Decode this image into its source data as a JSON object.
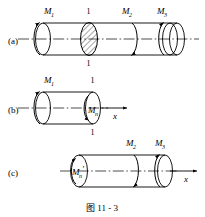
{
  "figure": {
    "caption": "图 11 - 3",
    "caption_number": "11 - 3",
    "caption_prefix": "图",
    "axis_label": "x",
    "section_marker": "1",
    "line_color": "#000000",
    "background_color": "#ffffff",
    "hatch_color": "#000000"
  },
  "panels": [
    {
      "id": "(a)",
      "name": "full-shaft",
      "torques": [
        {
          "base": "M",
          "sub": "1",
          "position": "left-end"
        },
        {
          "base": "M",
          "sub": "2",
          "position": "middle-right"
        },
        {
          "base": "M",
          "sub": "3",
          "position": "right-end"
        }
      ],
      "section_labels": [
        {
          "text": "1",
          "position": "top"
        },
        {
          "text": "1",
          "position": "bottom"
        }
      ],
      "has_hatched_section": true,
      "has_axis_arrow": false
    },
    {
      "id": "(b)",
      "name": "left-free-body",
      "torques": [
        {
          "base": "M",
          "sub": "1",
          "position": "left-end"
        },
        {
          "base": "M",
          "sub": "n",
          "position": "cut-face"
        }
      ],
      "section_labels": [
        {
          "text": "1",
          "position": "top"
        },
        {
          "text": "1",
          "position": "bottom"
        }
      ],
      "has_hatched_section": false,
      "has_axis_arrow": true,
      "axis_label": "x"
    },
    {
      "id": "(c)",
      "name": "right-free-body",
      "torques": [
        {
          "base": "M",
          "sub": "n",
          "prime": "'",
          "position": "cut-face"
        },
        {
          "base": "M",
          "sub": "2",
          "position": "middle-right"
        },
        {
          "base": "M",
          "sub": "3",
          "position": "right-end"
        }
      ],
      "section_labels": [],
      "has_hatched_section": false,
      "has_axis_arrow": true,
      "axis_label": "x"
    }
  ]
}
